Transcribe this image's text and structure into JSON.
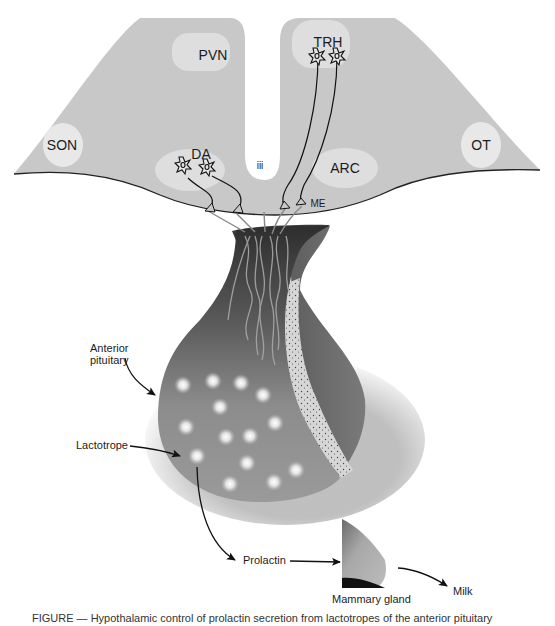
{
  "diagram": {
    "hypothalamus": {
      "fill": "#c8c8c8",
      "nuclei": [
        {
          "id": "pvn",
          "label": "PVN",
          "x": 213,
          "y": 55
        },
        {
          "id": "trh",
          "label": "TRH",
          "x": 328,
          "y": 42
        },
        {
          "id": "son",
          "label": "SON",
          "x": 62,
          "y": 145
        },
        {
          "id": "da",
          "label": "DA",
          "x": 201,
          "y": 155
        },
        {
          "id": "third-ventricle",
          "label": "iii",
          "x": 260,
          "y": 165
        },
        {
          "id": "arc",
          "label": "ARC",
          "x": 345,
          "y": 168
        },
        {
          "id": "ot",
          "label": "OT",
          "x": 481,
          "y": 145
        },
        {
          "id": "me",
          "label": "ME",
          "x": 318,
          "y": 204
        }
      ]
    },
    "pituitary": {
      "label": "Anterior pituitary",
      "label_line1": "Anterior",
      "label_line2": "pituitary",
      "cell_label": "Lactotrope"
    },
    "flow": {
      "hormone": "Prolactin",
      "target": "Mammary gland",
      "product": "Milk"
    },
    "colors": {
      "hypothalamus": "#c8c8c8",
      "nucleus_fill": "#e4e4e4",
      "ventricle": "#ffffff",
      "pituitary_dark": "#3a3a3a",
      "pituitary_mid": "#8a8a8a",
      "posterior_band": "#d8d8d8",
      "axon": "#9a9a9a",
      "outline": "#222222"
    },
    "caption": "FIGURE — Hypothalamic control of prolactin secretion from lactotropes of the anterior pituitary"
  }
}
